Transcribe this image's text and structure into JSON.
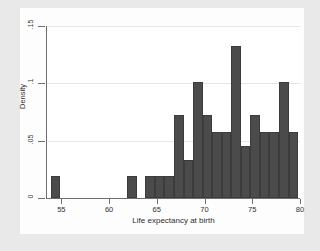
{
  "chart_data": {
    "type": "bar",
    "title": "",
    "xlabel": "Life expectancy at birth",
    "ylabel": "Density",
    "xlim": [
      53.5,
      80
    ],
    "ylim": [
      0,
      0.15
    ],
    "xticks": [
      55,
      60,
      65,
      70,
      75,
      80
    ],
    "xtick_labels": [
      "55",
      "60",
      "65",
      "70",
      "75",
      "80"
    ],
    "yticks": [
      0,
      0.05,
      0.1,
      0.15
    ],
    "ytick_labels": [
      "0",
      ".05",
      ".1",
      ".15"
    ],
    "grid": "horizontal",
    "legend": "none",
    "bin_width": 1,
    "bar_color": "#4b4b4b",
    "panel_color": "#ffffff",
    "figure_color": "#e9e9e9",
    "bins": [
      {
        "x0": 53.9,
        "x1": 54.9,
        "value": 0.019
      },
      {
        "x0": 61.9,
        "x1": 62.9,
        "value": 0.019
      },
      {
        "x0": 63.8,
        "x1": 64.8,
        "value": 0.019
      },
      {
        "x0": 64.8,
        "x1": 65.8,
        "value": 0.019
      },
      {
        "x0": 65.8,
        "x1": 66.8,
        "value": 0.019
      },
      {
        "x0": 66.8,
        "x1": 67.8,
        "value": 0.072
      },
      {
        "x0": 67.8,
        "x1": 68.8,
        "value": 0.033
      },
      {
        "x0": 68.8,
        "x1": 69.8,
        "value": 0.101
      },
      {
        "x0": 69.8,
        "x1": 70.8,
        "value": 0.072
      },
      {
        "x0": 70.8,
        "x1": 71.8,
        "value": 0.058
      },
      {
        "x0": 71.8,
        "x1": 72.8,
        "value": 0.058
      },
      {
        "x0": 72.8,
        "x1": 73.8,
        "value": 0.133
      },
      {
        "x0": 73.8,
        "x1": 74.8,
        "value": 0.045
      },
      {
        "x0": 74.8,
        "x1": 75.8,
        "value": 0.072
      },
      {
        "x0": 75.8,
        "x1": 76.8,
        "value": 0.058
      },
      {
        "x0": 76.8,
        "x1": 77.8,
        "value": 0.058
      },
      {
        "x0": 77.8,
        "x1": 78.8,
        "value": 0.101
      },
      {
        "x0": 78.8,
        "x1": 79.8,
        "value": 0.058
      }
    ]
  }
}
